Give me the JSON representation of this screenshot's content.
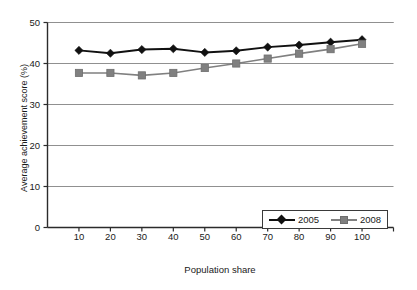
{
  "chart_data": {
    "type": "line",
    "title": "",
    "xlabel": "Population share",
    "ylabel": "Average achievement score (%)",
    "x": [
      10,
      20,
      30,
      40,
      50,
      60,
      70,
      80,
      90,
      100
    ],
    "xlim": [
      0,
      110
    ],
    "ylim": [
      0,
      50
    ],
    "x_ticks": [
      "10",
      "20",
      "30",
      "40",
      "50",
      "60",
      "70",
      "80",
      "90",
      "100"
    ],
    "y_ticks": [
      "0",
      "10",
      "20",
      "30",
      "40",
      "50"
    ],
    "grid": "horizontal",
    "legend_position": "bottom-right",
    "series": [
      {
        "name": "2005",
        "color": "#111111",
        "marker": "diamond",
        "values": [
          43.2,
          42.5,
          43.4,
          43.6,
          42.7,
          43.1,
          44.0,
          44.5,
          45.2,
          45.8
        ]
      },
      {
        "name": "2008",
        "color": "#808080",
        "marker": "square",
        "values": [
          37.7,
          37.7,
          37.1,
          37.7,
          38.9,
          40.0,
          41.2,
          42.4,
          43.5,
          44.8
        ]
      }
    ]
  },
  "legend": {
    "entries": [
      {
        "label": "2005"
      },
      {
        "label": "2008"
      }
    ]
  },
  "colors": {
    "series_2005": "#111111",
    "series_2008": "#808080",
    "gridline": "#909090",
    "axis": "#2b2b2b",
    "background": "#ffffff"
  }
}
